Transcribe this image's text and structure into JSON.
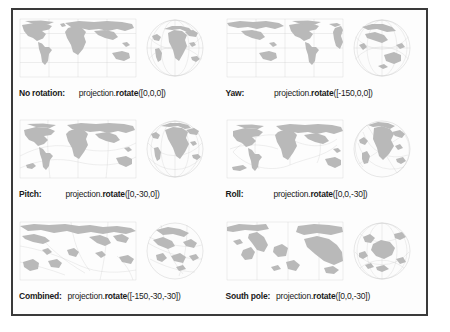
{
  "figure": {
    "border_color": "#3a3a3a",
    "land_color": "#b9b9b9",
    "graticule_color": "#c9c9c9"
  },
  "panels": [
    {
      "id": "no-rotation",
      "label": "No rotation:",
      "code_prefix": "projection.",
      "code_method": "rotate",
      "code_args": "([0,0,0])",
      "code_full": "projection.rotate([0,0,0])",
      "rotation": [
        0,
        0,
        0
      ],
      "map_kind": "equirectangular",
      "globe_kind": "orthographic",
      "globe_center": "Africa / Europe"
    },
    {
      "id": "yaw",
      "label": "Yaw:",
      "code_prefix": "projection.",
      "code_method": "rotate",
      "code_args": "([-150,0,0])",
      "code_full": "projection.rotate([-150,0,0])",
      "rotation": [
        -150,
        0,
        0
      ],
      "map_kind": "equirectangular",
      "globe_kind": "orthographic",
      "globe_center": "Asia / Australia"
    },
    {
      "id": "pitch",
      "label": "Pitch:",
      "code_prefix": "projection.",
      "code_method": "rotate",
      "code_args": "([0,-30,0])",
      "code_full": "projection.rotate([0,-30,0])",
      "rotation": [
        0,
        -30,
        0
      ],
      "map_kind": "equirectangular",
      "globe_kind": "orthographic",
      "globe_center": "Africa / Europe tilted"
    },
    {
      "id": "roll",
      "label": "Roll:",
      "code_prefix": "projection.",
      "code_method": "rotate",
      "code_args": "([0,0,-30])",
      "code_full": "projection.rotate([0,0,-30])",
      "rotation": [
        0,
        0,
        -30
      ],
      "map_kind": "equirectangular",
      "globe_kind": "orthographic",
      "globe_center": "Africa / Europe rolled"
    },
    {
      "id": "combined",
      "label": "Combined:",
      "code_prefix": "projection.",
      "code_method": "rotate",
      "code_args": "([-150,-30,-30])",
      "code_full": "projection.rotate([-150,-30,-30])",
      "rotation": [
        -150,
        -30,
        -30
      ],
      "map_kind": "equirectangular",
      "globe_kind": "orthographic",
      "globe_center": "Pacific tilted"
    },
    {
      "id": "south-pole",
      "label": "South pole:",
      "code_prefix": "projection.",
      "code_method": "rotate",
      "code_args": "([0,0,-30])",
      "code_full": "projection.rotate([0,0,-30])",
      "rotation": [
        0,
        0,
        -30
      ],
      "map_kind": "equirectangular",
      "globe_kind": "orthographic",
      "globe_center": "Antarctica"
    }
  ]
}
